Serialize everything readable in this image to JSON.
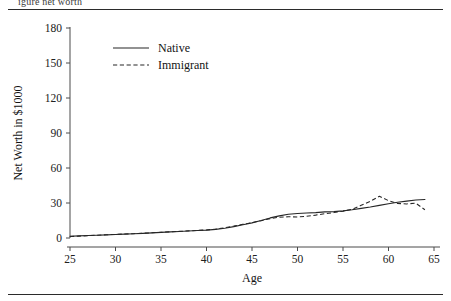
{
  "figure": {
    "clipped_caption_fragment": "igure          net worth",
    "rules": {
      "top_label": "top-rule",
      "bottom_label": "bottom-rule"
    }
  },
  "chart_data": {
    "type": "line",
    "title": "",
    "xlabel": "Age",
    "ylabel": "Net Worth in $1000",
    "xlim": [
      25,
      65
    ],
    "ylim": [
      0,
      180
    ],
    "xticks": [
      25,
      30,
      35,
      40,
      45,
      50,
      55,
      60,
      65
    ],
    "xtick_labels": [
      "25",
      "30",
      "35",
      "40",
      "45",
      "50",
      "55",
      "60",
      "65"
    ],
    "yticks": [
      0,
      30,
      60,
      90,
      120,
      150,
      180
    ],
    "ytick_labels": [
      "0",
      "30",
      "60",
      "90",
      "120",
      "150",
      "180"
    ],
    "grid": false,
    "legend_position": "upper-left-inside",
    "x": [
      25,
      26,
      27,
      28,
      29,
      30,
      31,
      32,
      33,
      34,
      35,
      36,
      37,
      38,
      39,
      40,
      41,
      42,
      43,
      44,
      45,
      46,
      47,
      48,
      49,
      50,
      51,
      52,
      53,
      54,
      55,
      56,
      57,
      58,
      59,
      60,
      61,
      62,
      63,
      64
    ],
    "series": [
      {
        "name": "Native",
        "style": "solid",
        "color": "#262626",
        "values": [
          1.5,
          1.8,
          2.1,
          2.4,
          2.7,
          3.0,
          3.3,
          3.6,
          4.0,
          4.4,
          4.8,
          5.2,
          5.6,
          6.0,
          6.4,
          6.8,
          7.4,
          8.4,
          9.8,
          11.4,
          13.0,
          15.0,
          17.2,
          19.0,
          20.4,
          21.0,
          21.4,
          21.8,
          22.4,
          22.6,
          23.2,
          24.2,
          25.4,
          26.6,
          28.0,
          29.4,
          30.6,
          31.6,
          32.6,
          33.0
        ]
      },
      {
        "name": "Immigrant",
        "style": "dashed",
        "color": "#262626",
        "values": [
          1.2,
          1.6,
          2.0,
          2.4,
          2.8,
          3.1,
          3.4,
          3.7,
          4.1,
          4.5,
          4.9,
          5.3,
          5.7,
          6.1,
          6.5,
          6.9,
          7.6,
          8.8,
          10.2,
          11.8,
          13.2,
          14.8,
          16.6,
          17.8,
          18.2,
          18.0,
          18.6,
          19.6,
          20.8,
          21.8,
          23.0,
          24.6,
          28.0,
          31.4,
          35.8,
          32.0,
          29.6,
          29.2,
          29.8,
          24.2
        ]
      }
    ]
  }
}
